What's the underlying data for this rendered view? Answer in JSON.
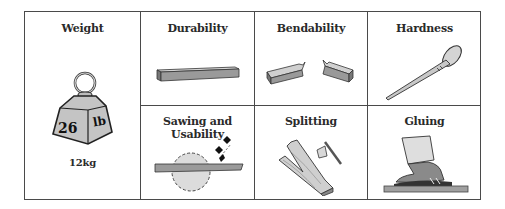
{
  "cells": [
    {
      "id": "weight",
      "title": "Weight",
      "icon": "weight-icon",
      "weight_number": "26",
      "weight_unit": "lb",
      "caption": "12kg"
    },
    {
      "id": "durability",
      "title": "Durability",
      "icon": "wooden-plank-icon"
    },
    {
      "id": "bendability",
      "title": "Bendability",
      "icon": "broken-plank-icon"
    },
    {
      "id": "hardness",
      "title": "Hardness",
      "icon": "nail-icon"
    },
    {
      "id": "sawing",
      "title": "Sawing and Usability",
      "icon": "saw-blade-icon"
    },
    {
      "id": "splitting",
      "title": "Splitting",
      "icon": "axe-split-log-icon"
    },
    {
      "id": "gluing",
      "title": "Gluing",
      "icon": "glued-shoe-icon"
    }
  ],
  "colors": {
    "border": "#4a4a4a",
    "fill": "#bcbcbc",
    "fill_dark": "#8a8a8a",
    "text": "#2a2a2a"
  }
}
